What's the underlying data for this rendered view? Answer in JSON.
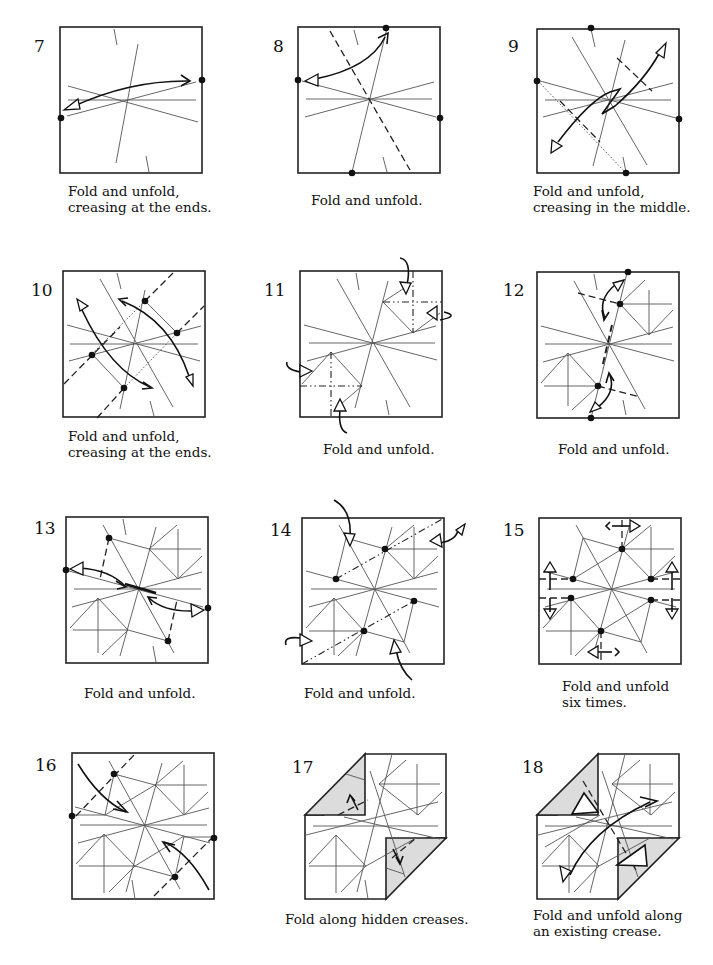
{
  "steps": [
    {
      "number": "7",
      "caption": [
        "Fold and unfold,",
        "creasing at the ends."
      ]
    },
    {
      "number": "8",
      "caption": [
        "Fold and unfold."
      ]
    },
    {
      "number": "9",
      "caption": [
        "Fold and unfold,",
        "creasing in the middle."
      ]
    },
    {
      "number": "10",
      "caption": [
        "Fold and unfold,",
        "creasing at the ends."
      ]
    },
    {
      "number": "11",
      "caption": [
        "Fold and unfold."
      ]
    },
    {
      "number": "12",
      "caption": [
        "Fold and unfold."
      ]
    },
    {
      "number": "13",
      "caption": [
        "Fold and unfold."
      ]
    },
    {
      "number": "14",
      "caption": [
        "Fold and unfold."
      ]
    },
    {
      "number": "15",
      "caption": [
        "Fold and unfold",
        "six times."
      ]
    },
    {
      "number": "16",
      "caption": []
    },
    {
      "number": "17",
      "caption": [
        "Fold along hidden creases."
      ]
    },
    {
      "number": "18",
      "caption": [
        "Fold and unfold along",
        "an existing crease."
      ]
    }
  ],
  "colors": {
    "line": "#222222",
    "crease": "#555555",
    "shade": "#dcdcdc",
    "background": "#ffffff"
  },
  "symbols": {
    "valley_fold": "dashed-line",
    "mountain_fold": "dash-dot-line",
    "reference_point": "black-dot",
    "fold_unfold_arrow": "double-headed-arrow"
  }
}
